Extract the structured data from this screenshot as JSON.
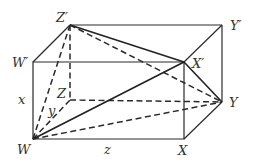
{
  "diagram": {
    "vertices": {
      "W": {
        "label": "W",
        "x": 33,
        "y": 138
      },
      "X": {
        "label": "X",
        "x": 184,
        "y": 139
      },
      "Y": {
        "label": "Y",
        "x": 222,
        "y": 102
      },
      "Z": {
        "label": "Z",
        "x": 70,
        "y": 100
      },
      "Wp": {
        "label": "W′",
        "x": 33,
        "y": 62
      },
      "Xp": {
        "label": "X′",
        "x": 184,
        "y": 62
      },
      "Yp": {
        "label": "Y′",
        "x": 222,
        "y": 25
      },
      "Zp": {
        "label": "Z′",
        "x": 70,
        "y": 25
      }
    },
    "edge_labels": {
      "x": "x",
      "y": "y",
      "z": "z"
    },
    "colors": {
      "line": "#2a2a2a",
      "text": "#333333",
      "background": "#ffffff"
    }
  }
}
